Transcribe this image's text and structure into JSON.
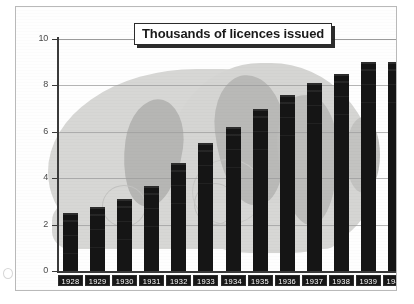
{
  "chart_data": {
    "type": "bar",
    "title": "Thousands of licences issued",
    "xlabel": "",
    "ylabel": "",
    "ylim": [
      0,
      10
    ],
    "yticks": [
      0,
      2,
      4,
      6,
      8,
      10
    ],
    "grid": true,
    "legend": "none",
    "categories": [
      "1928",
      "1929",
      "1930",
      "1931",
      "1932",
      "1933",
      "1934",
      "1935",
      "1936",
      "1937",
      "1938",
      "1939",
      "1940"
    ],
    "values": [
      2.5,
      2.75,
      3.1,
      3.65,
      4.65,
      5.5,
      6.2,
      7.0,
      7.6,
      8.1,
      8.5,
      9.0,
      9.0
    ],
    "series": [
      {
        "name": "Licences issued",
        "values": [
          2.5,
          2.75,
          3.1,
          3.65,
          4.65,
          5.5,
          6.2,
          7.0,
          7.6,
          8.1,
          8.5,
          9.0,
          9.0
        ]
      }
    ]
  },
  "colors": {
    "bar": "#151515",
    "axis": "#3a3a3a",
    "gridline": "#9e9e9e",
    "watermark_light": "#d6d6d4",
    "watermark_dark": "#b8b8b6",
    "label_tab_background": "#171717",
    "label_tab_text": "#ffffff",
    "page_background": "#ffffff",
    "frame_border": "#b9b9b9"
  }
}
